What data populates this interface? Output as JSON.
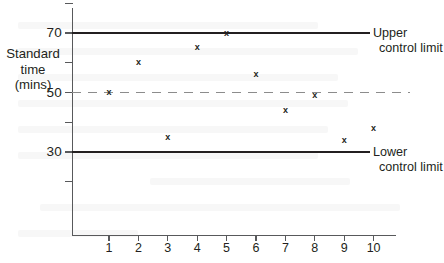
{
  "chart_data": {
    "type": "scatter",
    "title": "",
    "xlabel": "",
    "ylabel": "Standard time (mins)",
    "ylabel_lines": [
      "Standard",
      "time",
      "(mins)"
    ],
    "categories": [
      "1",
      "2",
      "3",
      "4",
      "5",
      "6",
      "7",
      "8",
      "9",
      "10"
    ],
    "x": [
      1,
      2,
      3,
      4,
      5,
      6,
      7,
      8,
      9,
      10
    ],
    "values": [
      50,
      60,
      35,
      65,
      70,
      56,
      44,
      49,
      34,
      38
    ],
    "series": [
      {
        "name": "Observed standard time",
        "marker": "x",
        "values": [
          50,
          60,
          35,
          65,
          70,
          56,
          44,
          49,
          34,
          38
        ]
      }
    ],
    "ylim": [
      10,
      80
    ],
    "xlim": [
      0,
      11
    ],
    "y_ticks": [
      80,
      70,
      60,
      50,
      40,
      30,
      20
    ],
    "y_tick_labels": [
      "",
      "70",
      "",
      "50",
      "",
      "30",
      ""
    ],
    "grid": false,
    "legend": "none",
    "reference_lines": [
      {
        "name": "upper-control-limit",
        "value": 70,
        "style": "solid",
        "color": "#231f20",
        "label": "Upper control limit",
        "label_lines": [
          "Upper",
          "control limit"
        ]
      },
      {
        "name": "centre-line",
        "value": 50,
        "style": "dashed",
        "color": "#8c8c8c",
        "label": "",
        "label_lines": []
      },
      {
        "name": "lower-control-limit",
        "value": 30,
        "style": "solid",
        "color": "#231f20",
        "label": "Lower control limit",
        "label_lines": [
          "Lower",
          "control limit"
        ]
      }
    ],
    "marker_glyph": "x",
    "colors": {
      "axis": "#58595b",
      "text": "#231f20",
      "limit_line": "#231f20",
      "centre_line": "#8c8c8c",
      "marker": "#231f20",
      "background": "#ffffff"
    }
  },
  "annotations": {
    "upper": {
      "line1": "Upper",
      "line2": "control limit"
    },
    "lower": {
      "line1": "Lower",
      "line2": "control limit"
    }
  },
  "axis_title": {
    "line1": "Standard",
    "line2": "time",
    "line3": "(mins)"
  }
}
